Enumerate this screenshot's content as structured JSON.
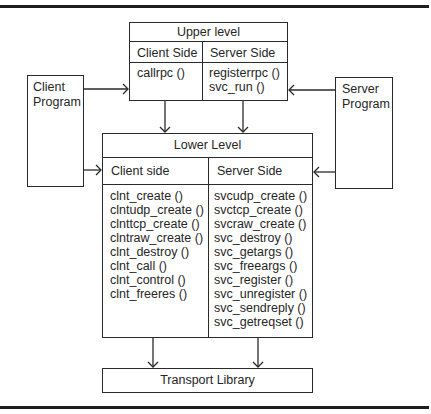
{
  "upper": {
    "title": "Upper level",
    "client_header": "Client Side",
    "server_header": "Server Side",
    "client_items": [
      "callrpc ()"
    ],
    "server_items": [
      "registerrpc ()",
      "svc_run ()"
    ]
  },
  "client_program": {
    "line1": "Client",
    "line2": "Program"
  },
  "server_program": {
    "line1": "Server",
    "line2": "Program"
  },
  "lower": {
    "title": "Lower Level",
    "client_header": "Client side",
    "server_header": "Server Side",
    "client_items": [
      "clnt_create ()",
      "clntudp_create ()",
      "clnttcp_create ()",
      "clntraw_create ()",
      "clnt_destroy ()",
      "clnt_call ()",
      "clnt_control ()",
      "clnt_freeres ()"
    ],
    "server_items": [
      "svcudp_create ()",
      "svctcp_create ()",
      "svcraw_create ()",
      "svc_destroy ()",
      "svc_getargs ()",
      "svc_freeargs ()",
      "svc_register ()",
      "svc_unregister ()",
      "svc_sendreply ()",
      "svc_getreqset ()"
    ]
  },
  "transport": {
    "label": "Transport Library"
  },
  "colors": {
    "line": "#2a2a2a",
    "text": "#262626",
    "background": "#ffffff"
  }
}
